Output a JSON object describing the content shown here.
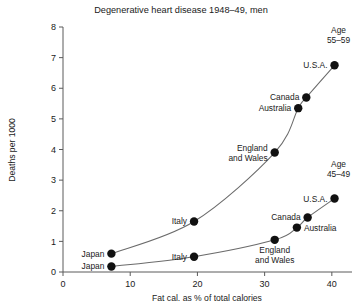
{
  "chart_data": {
    "type": "scatter",
    "title": "Degenerative heart disease 1948–49, men",
    "xlabel": "Fat cal. as % of total calories",
    "ylabel": "Deaths per 1000",
    "xlim": [
      0,
      43
    ],
    "ylim": [
      0,
      8
    ],
    "xticks": [
      0,
      10,
      20,
      30,
      40
    ],
    "yticks": [
      0,
      1,
      2,
      3,
      4,
      5,
      6,
      7,
      8
    ],
    "grid": false,
    "legend": "inline-annotations",
    "series": [
      {
        "name": "Age 55–59",
        "label": "Age",
        "label_line2": "55–59",
        "points": [
          {
            "country": "Japan",
            "x": 7.2,
            "y": 0.6,
            "label": "Japan",
            "label_pos": "left"
          },
          {
            "country": "Italy",
            "x": 19.5,
            "y": 1.65,
            "label": "Italy",
            "label_pos": "left"
          },
          {
            "country": "England and Wales",
            "x": 31.5,
            "y": 3.9,
            "label": "England",
            "label_line2": "and Wales",
            "label_pos": "left"
          },
          {
            "country": "Australia",
            "x": 35.0,
            "y": 5.35,
            "label": "Australia",
            "label_pos": "left"
          },
          {
            "country": "Canada",
            "x": 36.2,
            "y": 5.7,
            "label": "Canada",
            "label_pos": "left"
          },
          {
            "country": "U.S.A.",
            "x": 40.4,
            "y": 6.75,
            "label": "U.S.A.",
            "label_pos": "left"
          }
        ]
      },
      {
        "name": "Age 45–49",
        "label": "Age",
        "label_line2": "45–49",
        "points": [
          {
            "country": "Japan",
            "x": 7.2,
            "y": 0.18,
            "label": "Japan",
            "label_pos": "left"
          },
          {
            "country": "Italy",
            "x": 19.5,
            "y": 0.5,
            "label": "Italy",
            "label_pos": "left"
          },
          {
            "country": "England and Wales",
            "x": 31.5,
            "y": 1.05,
            "label": "England",
            "label_line2": "and Wales",
            "label_pos": "below"
          },
          {
            "country": "Australia",
            "x": 34.8,
            "y": 1.45,
            "label": "Australia",
            "label_pos": "right"
          },
          {
            "country": "Canada",
            "x": 36.4,
            "y": 1.78,
            "label": "Canada",
            "label_pos": "left"
          },
          {
            "country": "U.S.A.",
            "x": 40.4,
            "y": 2.4,
            "label": "U.S.A.",
            "label_pos": "left"
          }
        ]
      }
    ]
  },
  "colors": {
    "point": "#111111",
    "curve": "#6b6b6b",
    "axis": "#5a5a5a",
    "text": "#1a1a1a",
    "background": "#ffffff"
  }
}
